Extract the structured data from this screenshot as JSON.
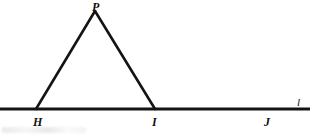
{
  "figure": {
    "background_color": "#ffffff",
    "stroke_color": "#141414",
    "labels": {
      "apex": "P",
      "base_left": "H",
      "base_right": "I",
      "point_on_line": "J",
      "line_name": "l"
    },
    "geometry": {
      "line": {
        "x1": 0,
        "y1": 109,
        "x2": 310,
        "y2": 109,
        "width": 3
      },
      "triangle": {
        "apex": {
          "x": 95,
          "y": 10
        },
        "left_base": {
          "x": 36,
          "y": 109
        },
        "right_base": {
          "x": 155,
          "y": 109
        },
        "stroke_width": 2.6
      },
      "point_j": {
        "x": 268,
        "y": 109
      }
    }
  }
}
